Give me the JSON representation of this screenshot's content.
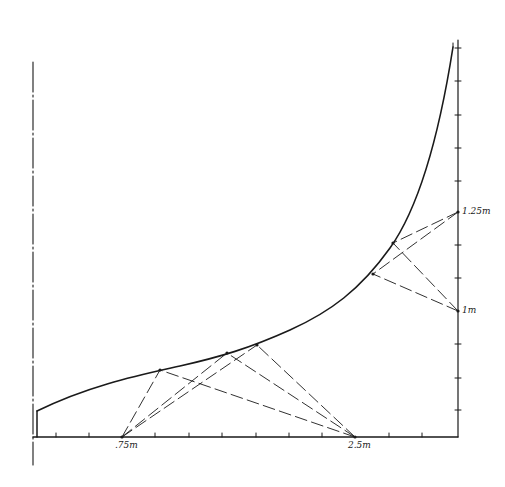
{
  "diagram": {
    "type": "technical drawing",
    "stroke_color": "#1a1a1a",
    "background": "#ffffff",
    "labels": {
      "bottom_left_point": ".75m",
      "bottom_right_point": "2.5m",
      "right_upper_point": "1.25m",
      "right_lower_point": "1m"
    },
    "axes": {
      "center_line": {
        "style": "dash-dot",
        "x": 33,
        "y1": 62,
        "y2": 465
      },
      "baseline": {
        "y": 437,
        "x1": 33,
        "x2": 458
      },
      "right_axis": {
        "x": 458,
        "y1": 40,
        "y2": 437
      },
      "bottom_ticks_x": [
        56,
        89,
        155,
        189,
        222,
        256,
        289,
        322,
        389,
        422
      ],
      "right_ticks_y": [
        48,
        81,
        115,
        148,
        181,
        245,
        278,
        344,
        378,
        410
      ]
    },
    "curve": {
      "description": "profile curve rising steeply toward the right axis",
      "start_step": [
        [
          37,
          437
        ],
        [
          37,
          411
        ]
      ],
      "path": "M37,411 C90,385 140,375 180,366 S250,348 290,330 S360,290 390,248 S440,130 453,47"
    },
    "focal_points": {
      "p_075": [
        122,
        437
      ],
      "p_25": [
        355,
        437
      ],
      "p_125": [
        458,
        212
      ],
      "p_1": [
        458,
        311
      ]
    },
    "curve_points": {
      "a": [
        160,
        370
      ],
      "b": [
        227,
        353
      ],
      "c": [
        257,
        345
      ],
      "d": [
        373,
        274
      ],
      "e": [
        393,
        243
      ]
    },
    "dashed_lines": [
      [
        "p_075",
        "a"
      ],
      [
        "p_075",
        "b"
      ],
      [
        "p_075",
        "c"
      ],
      [
        "p_25",
        "a"
      ],
      [
        "p_25",
        "b"
      ],
      [
        "p_25",
        "c"
      ],
      [
        "p_125",
        "d"
      ],
      [
        "p_125",
        "e"
      ],
      [
        "p_1",
        "d"
      ],
      [
        "p_1",
        "e"
      ]
    ]
  }
}
